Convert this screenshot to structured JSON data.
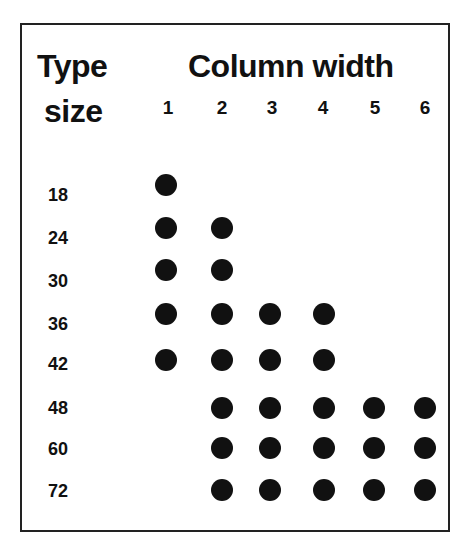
{
  "chart_data": {
    "type": "scatter",
    "ylabel": "Type size",
    "xlabel": "Column width",
    "x_categories": [
      "1",
      "2",
      "3",
      "4",
      "5",
      "6"
    ],
    "y_categories": [
      "18",
      "24",
      "30",
      "36",
      "42",
      "48",
      "60",
      "72"
    ],
    "points": [
      {
        "type_size": 18,
        "columns": [
          1
        ]
      },
      {
        "type_size": 24,
        "columns": [
          1,
          2
        ]
      },
      {
        "type_size": 30,
        "columns": [
          1,
          2
        ]
      },
      {
        "type_size": 36,
        "columns": [
          1,
          2,
          3,
          4
        ]
      },
      {
        "type_size": 42,
        "columns": [
          1,
          2,
          3,
          4
        ]
      },
      {
        "type_size": 48,
        "columns": [
          2,
          3,
          4,
          5,
          6
        ]
      },
      {
        "type_size": 60,
        "columns": [
          2,
          3,
          4,
          5,
          6
        ]
      },
      {
        "type_size": 72,
        "columns": [
          2,
          3,
          4,
          5,
          6
        ]
      }
    ],
    "grid": false,
    "legend": null,
    "marker_color": "#111111"
  },
  "header": {
    "type_line1": "Type",
    "type_line2": "size",
    "column_title": "Column width"
  },
  "columns": [
    "1",
    "2",
    "3",
    "4",
    "5",
    "6"
  ],
  "rows": [
    "18",
    "24",
    "30",
    "36",
    "42",
    "48",
    "60",
    "72"
  ]
}
